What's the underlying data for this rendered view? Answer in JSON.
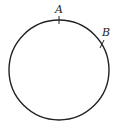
{
  "diagram": {
    "type": "circle-with-points",
    "circle": {
      "cx": 59,
      "cy": 70,
      "r": 50,
      "stroke": "#222222"
    },
    "points": [
      {
        "label": "A",
        "position": "top"
      },
      {
        "label": "B",
        "position": "upper-right"
      }
    ]
  }
}
